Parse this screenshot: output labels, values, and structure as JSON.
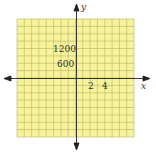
{
  "graph": {
    "x_axis_label": "x",
    "y_axis_label": "y",
    "x_tick_labels": [
      "2",
      "4"
    ],
    "y_tick_labels": [
      "1200",
      "600"
    ],
    "grid_color": "#f7f39a",
    "grid_line_color": "#b9b36a",
    "axis_color": "#222222",
    "grid_cells": 16,
    "x_scale": 2,
    "y_scale": 600
  }
}
